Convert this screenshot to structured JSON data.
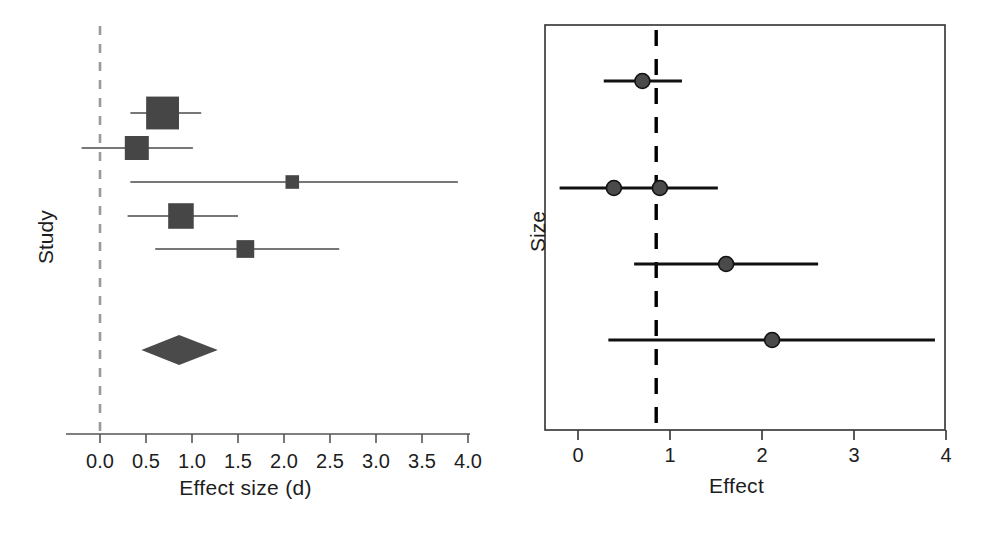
{
  "figure": {
    "title": "",
    "panel_count": 2,
    "background": "#ffffff",
    "ink": "#3a3a3a"
  },
  "panels": {
    "left": {
      "name": "forest-plot-study",
      "ylabel": "Study",
      "xlabel": "Effect size (d)",
      "frame": "x-axis-only",
      "ref_line_value": "0.0",
      "xticks": [
        "0.0",
        "0.5",
        "1.0",
        "1.5",
        "2.0",
        "2.5",
        "3.0",
        "3.5",
        "4.0"
      ]
    },
    "right": {
      "name": "forest-plot-size",
      "ylabel": "Size",
      "xlabel": "Effect",
      "frame": "box",
      "ref_line_value": "0.85",
      "xticks": [
        "0",
        "1",
        "2",
        "3",
        "4"
      ]
    }
  },
  "chart_data": [
    {
      "type": "forest",
      "panel": "left",
      "title": "",
      "xlabel": "Effect size (d)",
      "ylabel": "Study",
      "xlim": [
        -0.35,
        4.1
      ],
      "xticks": [
        0.0,
        0.5,
        1.0,
        1.5,
        2.0,
        2.5,
        3.0,
        3.5,
        4.0
      ],
      "xticklabels": [
        "0.0",
        "0.5",
        "1.0",
        "1.5",
        "2.0",
        "2.5",
        "3.0",
        "3.5",
        "4.0"
      ],
      "grid": false,
      "legend": "none",
      "reference_line": {
        "value": 0.0,
        "style": "dashed",
        "color": "#9a9a9a"
      },
      "marker": "square-weighted",
      "studies": [
        {
          "row": 1,
          "effect": 0.68,
          "ci_low": 0.33,
          "ci_high": 1.1,
          "weight": 0.42
        },
        {
          "row": 2,
          "effect": 0.4,
          "ci_low": -0.2,
          "ci_high": 1.01,
          "weight": 0.25
        },
        {
          "row": 3,
          "effect": 2.09,
          "ci_low": 0.33,
          "ci_high": 3.89,
          "weight": 0.05
        },
        {
          "row": 4,
          "effect": 0.88,
          "ci_low": 0.3,
          "ci_high": 1.5,
          "weight": 0.28
        },
        {
          "row": 5,
          "effect": 1.58,
          "ci_low": 0.6,
          "ci_high": 2.6,
          "weight": 0.13
        }
      ],
      "summary": {
        "effect": 0.86,
        "ci_low": 0.45,
        "ci_high": 1.28,
        "shape": "diamond"
      }
    },
    {
      "type": "forest",
      "panel": "right",
      "title": "",
      "xlabel": "Effect",
      "ylabel": "Size",
      "xlim": [
        -0.38,
        4.05
      ],
      "xticks": [
        0,
        1,
        2,
        3,
        4
      ],
      "xticklabels": [
        "0",
        "1",
        "2",
        "3",
        "4"
      ],
      "grid": false,
      "legend": "none",
      "reference_line": {
        "value": 0.85,
        "style": "dashed",
        "color": "#000000"
      },
      "marker": "circle",
      "studies": [
        {
          "row": 1,
          "effect": 0.7,
          "ci_low": 0.28,
          "ci_high": 1.13
        },
        {
          "row": 2,
          "effect": 0.39,
          "extra_effect": 0.89,
          "ci_low": -0.2,
          "ci_high": 1.52
        },
        {
          "row": 3,
          "effect": 1.61,
          "ci_low": 0.61,
          "ci_high": 2.61
        },
        {
          "row": 4,
          "effect": 2.11,
          "ci_low": 0.33,
          "ci_high": 3.88
        }
      ]
    }
  ]
}
